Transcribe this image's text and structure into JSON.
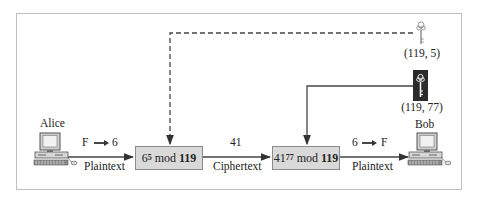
{
  "diagram": {
    "sender": {
      "name": "Alice"
    },
    "receiver": {
      "name": "Bob"
    },
    "encrypt_box": {
      "base": "6",
      "exponent": "5",
      "mod_word": "mod",
      "modulus": "119"
    },
    "decrypt_box": {
      "base": "41",
      "exponent": "77",
      "mod_word": "mod",
      "modulus": "119"
    },
    "edges": {
      "alice_to_encrypt": {
        "top": "F",
        "top_right": "6",
        "bottom": "Plaintext"
      },
      "encrypt_to_decrypt": {
        "top": "41",
        "bottom": "Ciphertext"
      },
      "decrypt_to_bob": {
        "top": "6",
        "top_right": "F",
        "bottom": "Plaintext"
      }
    },
    "public_key": {
      "label": "(119, 5)",
      "icon": "key-icon-light"
    },
    "private_key": {
      "label": "(119, 77)",
      "icon": "key-icon-dark"
    },
    "colors": {
      "box_fill": "#d9d9d9",
      "box_border": "#8a8a8a",
      "line": "#444444",
      "private_key_bg": "#2b2b2b"
    }
  }
}
